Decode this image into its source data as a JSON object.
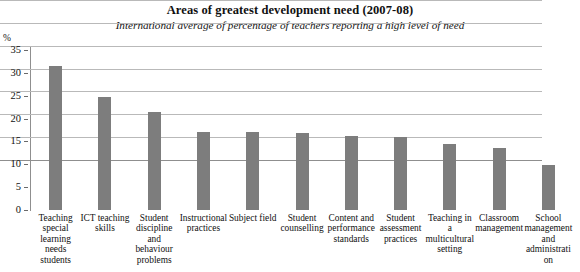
{
  "chart_data": {
    "type": "bar",
    "title": "Areas of greatest development need (2007-08)",
    "subtitle": "International average of percentage of teachers reporting a high level of need",
    "xlabel": "",
    "ylabel": "%",
    "ylim": [
      0,
      35
    ],
    "yticks": [
      0,
      5,
      10,
      15,
      20,
      25,
      30,
      35
    ],
    "ytick_labels": [
      "0",
      "5",
      "10",
      "15",
      "20",
      "25",
      "30",
      "35"
    ],
    "grid": true,
    "legend": false,
    "bar_color": "#7d7d7d",
    "categories": [
      "Teaching special learning needs students",
      "ICT teaching skills",
      "Student discipline and behaviour problems",
      "Instructional practices",
      "Subject field",
      "Student counselling",
      "Content and performance standards",
      "Student assessment practices",
      "Teaching in a multicultural setting",
      "Classroom management",
      "School management and administration"
    ],
    "values": [
      31.5,
      24.8,
      21.5,
      17.0,
      17.0,
      16.8,
      16.3,
      16.0,
      14.5,
      13.5,
      9.8
    ]
  }
}
